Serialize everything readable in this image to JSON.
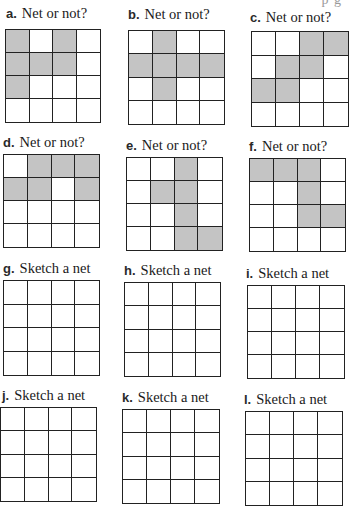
{
  "page": {
    "top_fragment": "p g"
  },
  "colors": {
    "shaded_cell": "#c4c4c4",
    "grid_line": "#222222",
    "background": "#ffffff"
  },
  "problems": [
    {
      "letter": "a.",
      "prompt": "Net or not?",
      "label_pos": [
        6,
        5
      ],
      "grid_pos": [
        5,
        29,
        96,
        94
      ],
      "cells": [
        [
          1,
          0,
          1,
          0
        ],
        [
          1,
          1,
          1,
          0
        ],
        [
          1,
          0,
          0,
          0
        ],
        [
          0,
          0,
          0,
          0
        ]
      ]
    },
    {
      "letter": "b.",
      "prompt": "Net or not?",
      "label_pos": [
        128,
        6
      ],
      "grid_pos": [
        128,
        30,
        97,
        95
      ],
      "cells": [
        [
          0,
          1,
          0,
          0
        ],
        [
          1,
          1,
          1,
          1
        ],
        [
          0,
          1,
          0,
          0
        ],
        [
          0,
          0,
          0,
          0
        ]
      ]
    },
    {
      "letter": "c.",
      "prompt": "Net or not?",
      "label_pos": [
        250,
        9
      ],
      "grid_pos": [
        251,
        31,
        98,
        96
      ],
      "cells": [
        [
          0,
          0,
          1,
          1
        ],
        [
          0,
          1,
          1,
          0
        ],
        [
          1,
          1,
          0,
          0
        ],
        [
          0,
          0,
          0,
          0
        ]
      ]
    },
    {
      "letter": "d.",
      "prompt": "Net or not?",
      "label_pos": [
        3,
        134
      ],
      "grid_pos": [
        3,
        154,
        97,
        94
      ],
      "cells": [
        [
          0,
          1,
          1,
          1
        ],
        [
          1,
          1,
          0,
          1
        ],
        [
          0,
          0,
          0,
          0
        ],
        [
          0,
          0,
          0,
          0
        ]
      ]
    },
    {
      "letter": "e.",
      "prompt": "Net or not?",
      "label_pos": [
        126,
        137
      ],
      "grid_pos": [
        126,
        157,
        97,
        94
      ],
      "cells": [
        [
          0,
          0,
          1,
          0
        ],
        [
          0,
          1,
          1,
          0
        ],
        [
          0,
          0,
          1,
          0
        ],
        [
          0,
          0,
          1,
          1
        ]
      ]
    },
    {
      "letter": "f.",
      "prompt": "Net or not?",
      "label_pos": [
        249,
        138
      ],
      "grid_pos": [
        249,
        158,
        97,
        94
      ],
      "cells": [
        [
          1,
          1,
          1,
          0
        ],
        [
          0,
          0,
          1,
          0
        ],
        [
          0,
          0,
          1,
          1
        ],
        [
          0,
          0,
          0,
          0
        ]
      ]
    },
    {
      "letter": "g.",
      "prompt": "Sketch a net",
      "label_pos": [
        3,
        260
      ],
      "grid_pos": [
        3,
        280,
        97,
        96
      ],
      "cells": [
        [
          0,
          0,
          0,
          0
        ],
        [
          0,
          0,
          0,
          0
        ],
        [
          0,
          0,
          0,
          0
        ],
        [
          0,
          0,
          0,
          0
        ]
      ]
    },
    {
      "letter": "h.",
      "prompt": "Sketch a net",
      "label_pos": [
        124,
        262
      ],
      "grid_pos": [
        124,
        282,
        97,
        95
      ],
      "cells": [
        [
          0,
          0,
          0,
          0
        ],
        [
          0,
          0,
          0,
          0
        ],
        [
          0,
          0,
          0,
          0
        ],
        [
          0,
          0,
          0,
          0
        ]
      ]
    },
    {
      "letter": "i.",
      "prompt": "Sketch a net",
      "label_pos": [
        246,
        265
      ],
      "grid_pos": [
        247,
        285,
        98,
        94
      ],
      "cells": [
        [
          0,
          0,
          0,
          0
        ],
        [
          0,
          0,
          0,
          0
        ],
        [
          0,
          0,
          0,
          0
        ],
        [
          0,
          0,
          0,
          0
        ]
      ]
    },
    {
      "letter": "j.",
      "prompt": "Sketch a net",
      "label_pos": [
        2,
        387
      ],
      "grid_pos": [
        0,
        407,
        97,
        95
      ],
      "cells": [
        [
          0,
          0,
          0,
          0
        ],
        [
          0,
          0,
          0,
          0
        ],
        [
          0,
          0,
          0,
          0
        ],
        [
          0,
          0,
          0,
          0
        ]
      ]
    },
    {
      "letter": "k.",
      "prompt": "Sketch a net",
      "label_pos": [
        122,
        389
      ],
      "grid_pos": [
        122,
        409,
        98,
        95
      ],
      "cells": [
        [
          0,
          0,
          0,
          0
        ],
        [
          0,
          0,
          0,
          0
        ],
        [
          0,
          0,
          0,
          0
        ],
        [
          0,
          0,
          0,
          0
        ]
      ]
    },
    {
      "letter": "l.",
      "prompt": "Sketch a net",
      "label_pos": [
        244,
        391
      ],
      "grid_pos": [
        245,
        411,
        98,
        95
      ],
      "cells": [
        [
          0,
          0,
          0,
          0
        ],
        [
          0,
          0,
          0,
          0
        ],
        [
          0,
          0,
          0,
          0
        ],
        [
          0,
          0,
          0,
          0
        ]
      ]
    }
  ]
}
